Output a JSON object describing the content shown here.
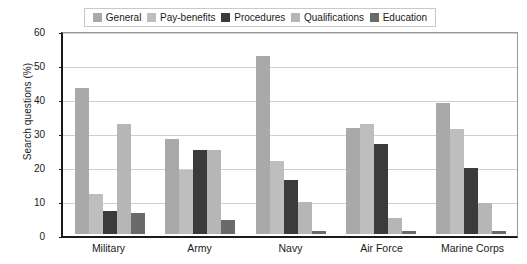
{
  "chart_data": {
    "type": "bar",
    "title": "",
    "xlabel": "",
    "ylabel": "Search questions (%)",
    "ylim": [
      0,
      60
    ],
    "yticks": [
      "0",
      "10",
      "20",
      "30",
      "40",
      "50",
      "60"
    ],
    "grid": true,
    "legend_position": "top",
    "categories": [
      "Military",
      "Army",
      "Navy",
      "Air Force",
      "Marine Corps"
    ],
    "series": [
      {
        "name": "General",
        "color": "#a9a9a9",
        "values": [
          42.8,
          28.0,
          52.3,
          31.2,
          38.5
        ]
      },
      {
        "name": "Pay-benefits",
        "color": "#bebebe",
        "values": [
          11.8,
          18.8,
          21.4,
          32.4,
          31.0
        ]
      },
      {
        "name": "Procedures",
        "color": "#3b3b3b",
        "values": [
          6.7,
          24.6,
          15.8,
          26.4,
          19.3
        ]
      },
      {
        "name": "Qualifications",
        "color": "#b6b6b6",
        "values": [
          32.4,
          24.6,
          9.4,
          4.7,
          9.2
        ]
      },
      {
        "name": "Education",
        "color": "#6a6a6a",
        "values": [
          6.3,
          4.1,
          1.0,
          0.8,
          1.0
        ]
      }
    ]
  },
  "legend": {
    "items": [
      {
        "label": "General"
      },
      {
        "label": "Pay-benefits"
      },
      {
        "label": "Procedures"
      },
      {
        "label": "Qualifications"
      },
      {
        "label": "Education"
      }
    ]
  }
}
